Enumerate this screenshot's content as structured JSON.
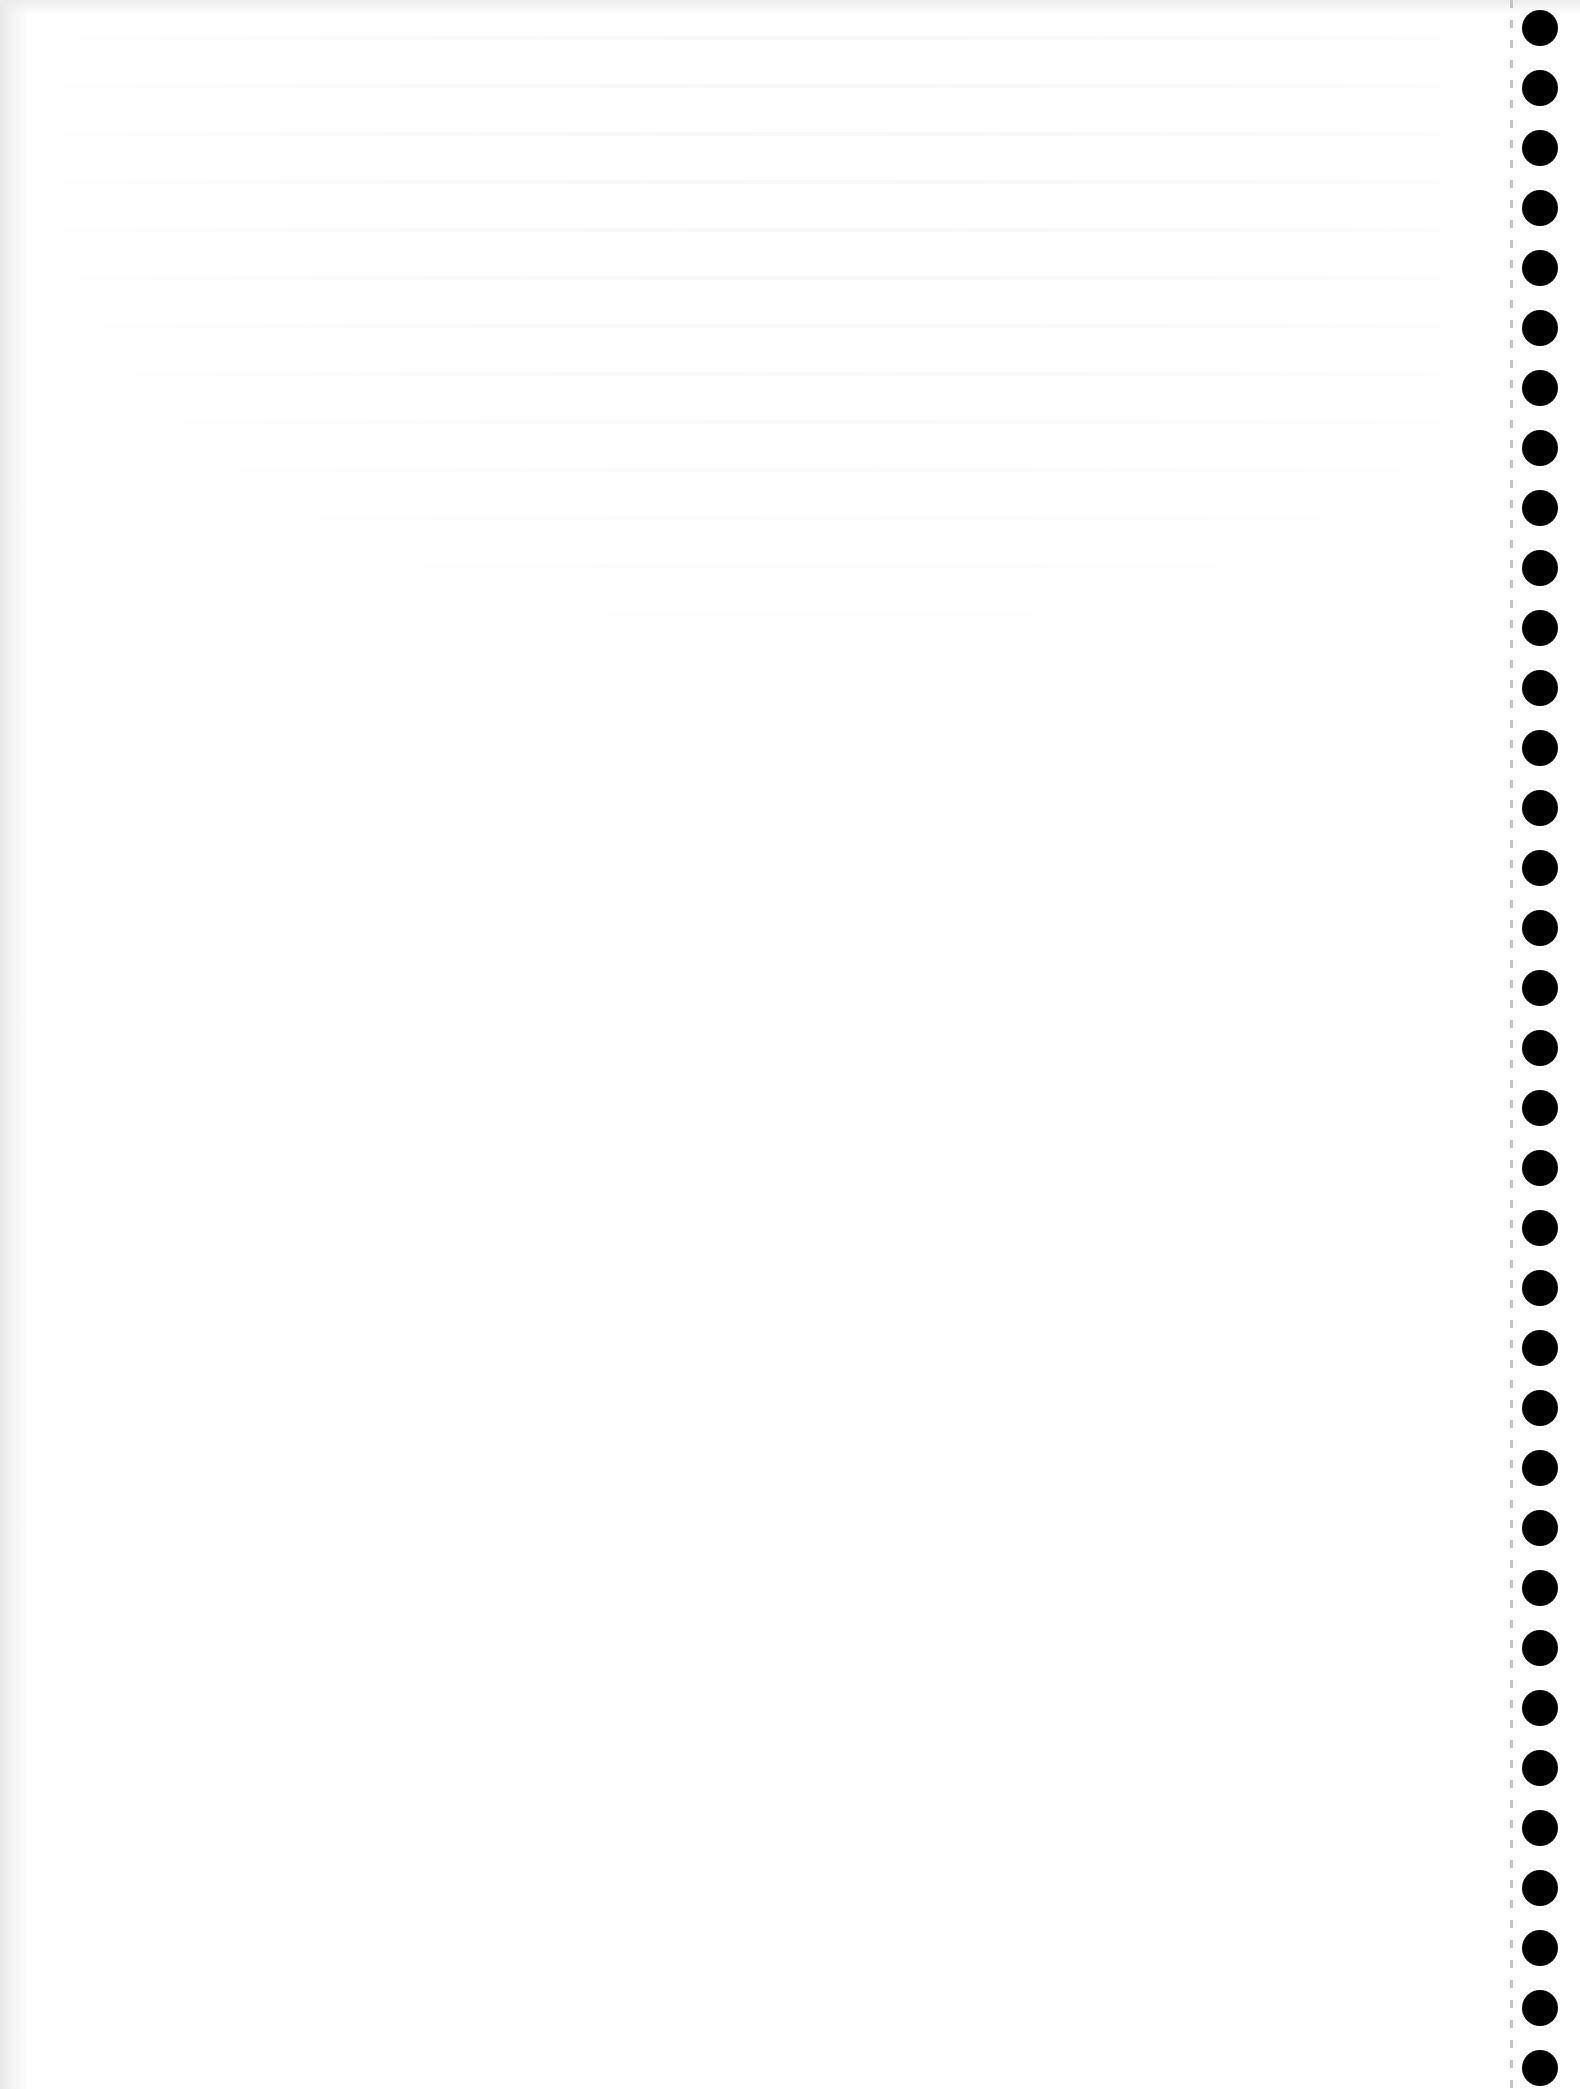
{
  "document": {
    "type": "blank continuous-form paper sheet",
    "paper_color": "#fefefe",
    "text_content": []
  },
  "tractor_feed": {
    "side": "right",
    "hole_count": 35,
    "hole_diameter_px": 36,
    "hole_center_x_px": 1540,
    "first_hole_center_y_px": 28,
    "hole_spacing_px": 60,
    "hole_color": "#000000",
    "perforation_line_x_px": 1510,
    "perforation_color": "#c4c4c4"
  }
}
